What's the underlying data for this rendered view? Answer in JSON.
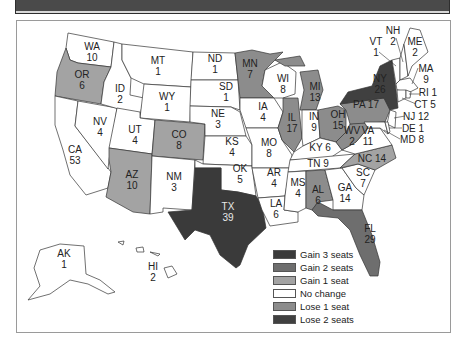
{
  "header": {
    "title": ""
  },
  "colors": {
    "gain3": "#3a3a3a",
    "gain2": "#6e6e6e",
    "gain1": "#a3a3a3",
    "nochange": "#ffffff",
    "lose1": "#8c8c8c",
    "lose2": "#404040"
  },
  "legend": [
    {
      "key": "gain3",
      "label": "Gain 3 seats"
    },
    {
      "key": "gain2",
      "label": "Gain 2 seats"
    },
    {
      "key": "gain1",
      "label": "Gain 1 seat"
    },
    {
      "key": "nochange",
      "label": "No change"
    },
    {
      "key": "lose1",
      "label": "Lose 1 seat"
    },
    {
      "key": "lose2",
      "label": "Lose 2 seats"
    }
  ],
  "chart_data": {
    "type": "heatmap",
    "title": "",
    "subtype": "choropleth-map-us-states",
    "legend_position": "bottom-right",
    "categories": [
      "Gain 3 seats",
      "Gain 2 seats",
      "Gain 1 seat",
      "No change",
      "Lose 1 seat",
      "Lose 2 seats"
    ],
    "states": [
      {
        "abbr": "WA",
        "seats": 10,
        "change": "No change"
      },
      {
        "abbr": "OR",
        "seats": 6,
        "change": "Gain 1 seat"
      },
      {
        "abbr": "CA",
        "seats": 53,
        "change": "No change"
      },
      {
        "abbr": "NV",
        "seats": 4,
        "change": "No change"
      },
      {
        "abbr": "ID",
        "seats": 2,
        "change": "No change"
      },
      {
        "abbr": "MT",
        "seats": 1,
        "change": "No change"
      },
      {
        "abbr": "WY",
        "seats": 1,
        "change": "No change"
      },
      {
        "abbr": "UT",
        "seats": 4,
        "change": "No change"
      },
      {
        "abbr": "AZ",
        "seats": 10,
        "change": "Gain 1 seat"
      },
      {
        "abbr": "CO",
        "seats": 8,
        "change": "Gain 1 seat"
      },
      {
        "abbr": "NM",
        "seats": 3,
        "change": "No change"
      },
      {
        "abbr": "ND",
        "seats": 1,
        "change": "No change"
      },
      {
        "abbr": "SD",
        "seats": 1,
        "change": "No change"
      },
      {
        "abbr": "NE",
        "seats": 3,
        "change": "No change"
      },
      {
        "abbr": "KS",
        "seats": 4,
        "change": "No change"
      },
      {
        "abbr": "OK",
        "seats": 5,
        "change": "No change"
      },
      {
        "abbr": "TX",
        "seats": 39,
        "change": "Gain 3 seats"
      },
      {
        "abbr": "MN",
        "seats": 7,
        "change": "Lose 1 seat"
      },
      {
        "abbr": "IA",
        "seats": 4,
        "change": "No change"
      },
      {
        "abbr": "MO",
        "seats": 8,
        "change": "No change"
      },
      {
        "abbr": "AR",
        "seats": 4,
        "change": "No change"
      },
      {
        "abbr": "LA",
        "seats": 6,
        "change": "No change"
      },
      {
        "abbr": "WI",
        "seats": 8,
        "change": "No change"
      },
      {
        "abbr": "IL",
        "seats": 17,
        "change": "Lose 1 seat"
      },
      {
        "abbr": "MI",
        "seats": 13,
        "change": "Lose 1 seat"
      },
      {
        "abbr": "IN",
        "seats": 9,
        "change": "No change"
      },
      {
        "abbr": "OH",
        "seats": 15,
        "change": "Lose 1 seat"
      },
      {
        "abbr": "KY",
        "seats": 6,
        "change": "No change"
      },
      {
        "abbr": "TN",
        "seats": 9,
        "change": "No change"
      },
      {
        "abbr": "MS",
        "seats": 4,
        "change": "No change"
      },
      {
        "abbr": "AL",
        "seats": 6,
        "change": "Lose 1 seat"
      },
      {
        "abbr": "GA",
        "seats": 14,
        "change": "No change"
      },
      {
        "abbr": "FL",
        "seats": 29,
        "change": "Gain 2 seats"
      },
      {
        "abbr": "SC",
        "seats": 7,
        "change": "No change"
      },
      {
        "abbr": "NC",
        "seats": 14,
        "change": "Gain 1 seat"
      },
      {
        "abbr": "VA",
        "seats": 11,
        "change": "No change"
      },
      {
        "abbr": "WV",
        "seats": 2,
        "change": "Lose 1 seat"
      },
      {
        "abbr": "PA",
        "seats": 17,
        "change": "Lose 1 seat"
      },
      {
        "abbr": "NY",
        "seats": 26,
        "change": "Lose 2 seats"
      },
      {
        "abbr": "VT",
        "seats": 1,
        "change": "No change"
      },
      {
        "abbr": "NH",
        "seats": 2,
        "change": "No change"
      },
      {
        "abbr": "ME",
        "seats": 2,
        "change": "No change"
      },
      {
        "abbr": "MA",
        "seats": 9,
        "change": "No change"
      },
      {
        "abbr": "RI",
        "seats": 1,
        "change": "No change"
      },
      {
        "abbr": "CT",
        "seats": 5,
        "change": "No change"
      },
      {
        "abbr": "NJ",
        "seats": 12,
        "change": "No change"
      },
      {
        "abbr": "DE",
        "seats": 1,
        "change": "No change"
      },
      {
        "abbr": "MD",
        "seats": 8,
        "change": "No change"
      },
      {
        "abbr": "AK",
        "seats": 1,
        "change": "No change"
      },
      {
        "abbr": "HI",
        "seats": 2,
        "change": "No change"
      }
    ]
  },
  "labels": {
    "WA": [
      "WA",
      "10"
    ],
    "OR": [
      "OR",
      "6"
    ],
    "CA": [
      "CA",
      "53"
    ],
    "NV": [
      "NV",
      "4"
    ],
    "ID": [
      "ID",
      "2"
    ],
    "MT": [
      "MT",
      "1"
    ],
    "WY": [
      "WY",
      "1"
    ],
    "UT": [
      "UT",
      "4"
    ],
    "AZ": [
      "AZ",
      "10"
    ],
    "CO": [
      "CO",
      "8"
    ],
    "NM": [
      "NM",
      "3"
    ],
    "ND": [
      "ND",
      "1"
    ],
    "SD": [
      "SD",
      "1"
    ],
    "NE": [
      "NE",
      "3"
    ],
    "KS": [
      "KS",
      "4"
    ],
    "OK": [
      "OK",
      "5"
    ],
    "TX": [
      "TX",
      "39"
    ],
    "MN": [
      "MN",
      "7"
    ],
    "IA": [
      "IA",
      "4"
    ],
    "MO": [
      "MO",
      "8"
    ],
    "AR": [
      "AR",
      "4"
    ],
    "LA": [
      "LA",
      "6"
    ],
    "WI": [
      "WI",
      "8"
    ],
    "IL": [
      "IL",
      "17"
    ],
    "MI": [
      "MI",
      "13"
    ],
    "IN": [
      "IN",
      "9"
    ],
    "OH": [
      "OH",
      "15"
    ],
    "KY": "KY 6",
    "TN": "TN 9",
    "MS": [
      "MS",
      "4"
    ],
    "AL": [
      "AL",
      "6"
    ],
    "GA": [
      "GA",
      "14"
    ],
    "FL": [
      "FL",
      "29"
    ],
    "SC": [
      "SC",
      "7"
    ],
    "NC": "NC 14",
    "VA": [
      "VA",
      "11"
    ],
    "WV": [
      "WV",
      "2"
    ],
    "PA": "PA 17",
    "NY": [
      "NY",
      "26"
    ],
    "VT": [
      "VT",
      "1"
    ],
    "NH": [
      "NH",
      "2"
    ],
    "ME": [
      "ME",
      "2"
    ],
    "MA": [
      "MA",
      "9"
    ],
    "RI": "RI 1",
    "CT": "CT 5",
    "NJ": "NJ 12",
    "DE": "DE 1",
    "MD": "MD 8",
    "AK": [
      "AK",
      "1"
    ],
    "HI": [
      "HI",
      "2"
    ]
  }
}
